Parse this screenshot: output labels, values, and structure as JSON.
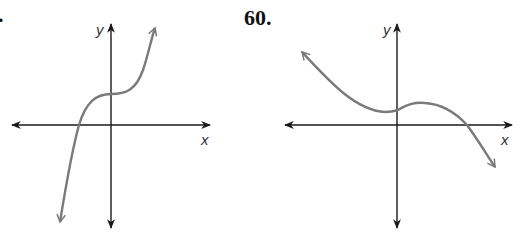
{
  "problems": [
    {
      "number_label": ".",
      "axes": {
        "x_label": "x",
        "y_label": "y"
      },
      "curve": {
        "description": "Increasing cubic with an inflection plateau above the origin; one x-intercept left of the y-axis",
        "end_behavior": {
          "left": "down",
          "right": "up"
        },
        "x_intercepts": 1,
        "y_intercept_sign": "positive"
      }
    },
    {
      "number_label": "60.",
      "axes": {
        "x_label": "x",
        "y_label": "y"
      },
      "curve": {
        "description": "Decreasing cubic with a local min just left of the y-axis and a local max right of it, both above the x-axis; one x-intercept on the right",
        "end_behavior": {
          "left": "up",
          "right": "down"
        },
        "x_intercepts": 1,
        "y_intercept_sign": "positive"
      }
    }
  ],
  "colors": {
    "axis": "#1a1a1a",
    "curve": "#7a7a7a",
    "background": "#ffffff"
  }
}
